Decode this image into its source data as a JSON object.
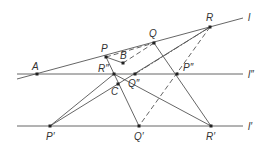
{
  "diagram": {
    "lines": [
      {
        "name": "l",
        "label": "l",
        "x1": 17,
        "y1": 79,
        "x2": 243,
        "y2": 18
      },
      {
        "name": "l-double-prime",
        "label": "l″",
        "x1": 17,
        "y1": 74,
        "x2": 243,
        "y2": 74
      },
      {
        "name": "l-prime",
        "label": "l′",
        "x1": 17,
        "y1": 126,
        "x2": 243,
        "y2": 126
      }
    ],
    "points": {
      "A": {
        "label": "A",
        "x": 37,
        "y": 74
      },
      "P": {
        "label": "P",
        "x": 106,
        "y": 57
      },
      "Q": {
        "label": "Q",
        "x": 154,
        "y": 43
      },
      "R": {
        "label": "R",
        "x": 210,
        "y": 27
      },
      "B": {
        "label": "B",
        "x": 123,
        "y": 63
      },
      "C": {
        "label": "C",
        "x": 118,
        "y": 84
      },
      "R2": {
        "label": "R″",
        "x": 114,
        "y": 74
      },
      "Q2": {
        "label": "Q″",
        "x": 135,
        "y": 74
      },
      "P2": {
        "label": "P″",
        "x": 177,
        "y": 74
      },
      "P1": {
        "label": "P′",
        "x": 50,
        "y": 126
      },
      "Q1": {
        "label": "Q′",
        "x": 139,
        "y": 126
      },
      "R1": {
        "label": "R′",
        "x": 211,
        "y": 126
      }
    }
  }
}
